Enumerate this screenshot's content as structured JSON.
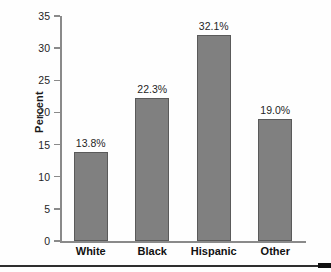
{
  "chart_data": {
    "type": "bar",
    "title": "",
    "xlabel": "",
    "ylabel": "Percent",
    "ylim": [
      0,
      35
    ],
    "grid": false,
    "legend": "none",
    "categories": [
      "White",
      "Black",
      "Hispanic",
      "Other"
    ],
    "values": [
      13.8,
      22.3,
      32.1,
      19.0
    ],
    "data_labels": [
      "13.8%",
      "22.3%",
      "32.1%",
      "19.0%"
    ],
    "y_ticks": [
      0,
      5,
      10,
      15,
      20,
      25,
      30,
      35
    ],
    "y_tick_labels": [
      "0",
      "5",
      "10",
      "15",
      "20",
      "25",
      "30",
      "35"
    ],
    "series": [
      {
        "name": "Percent",
        "values": [
          13.8,
          22.3,
          32.1,
          19.0
        ]
      }
    ]
  },
  "style": {
    "bar_fill": "#808080",
    "bar_edge": "#5a5a5a",
    "axis_color": "#8a8a8a",
    "text_color": "#1f1f1f",
    "background": "#fefefe",
    "rule_color": "#2e2e2e"
  }
}
